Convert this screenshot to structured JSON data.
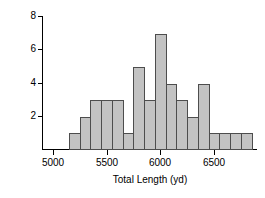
{
  "chart_data": {
    "type": "bar",
    "title": "",
    "xlabel": "Total Length (yd)",
    "ylabel": "# of BC Golf Courses",
    "xlim": [
      4900,
      6900
    ],
    "ylim": [
      0,
      8
    ],
    "grid": false,
    "legend": null,
    "bin_width": 100,
    "xticks": [
      5000,
      5500,
      6000,
      6500
    ],
    "xtick_labels": [
      "5000",
      "5500",
      "6000",
      "6500"
    ],
    "yticks": [
      2,
      4,
      6,
      8
    ],
    "ytick_labels": [
      "2",
      "4",
      "6",
      "8"
    ],
    "bin_starts": [
      5150,
      5250,
      5350,
      5450,
      5550,
      5650,
      5750,
      5850,
      5950,
      6050,
      6150,
      6250,
      6350,
      6450,
      6550,
      6650,
      6750
    ],
    "bin_ends": [
      5250,
      5350,
      5450,
      5550,
      5650,
      5750,
      5850,
      5950,
      6050,
      6150,
      6250,
      6350,
      6450,
      6550,
      6650,
      6750,
      6850
    ],
    "categories": [
      "5150-5250",
      "5250-5350",
      "5350-5450",
      "5450-5550",
      "5550-5650",
      "5650-5750",
      "5750-5850",
      "5850-5950",
      "5950-6050",
      "6050-6150",
      "6150-6250",
      "6250-6350",
      "6350-6450",
      "6450-6550",
      "6550-6650",
      "6650-6750",
      "6750-6850"
    ],
    "values": [
      1,
      2,
      3,
      3,
      3,
      1,
      5,
      3,
      7,
      4,
      3,
      2,
      4,
      1,
      1,
      1,
      1
    ],
    "bar_color": "#c3c3c3",
    "bar_edge_color": "#4d4d4d",
    "axis_color": "#000000"
  },
  "axes": {
    "ylabel": "# of BC Golf Courses",
    "xlabel": "Total Length (yd)"
  }
}
